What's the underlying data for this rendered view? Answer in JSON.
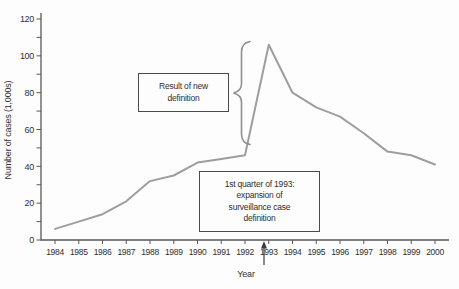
{
  "figure": {
    "bg": "#fdfdfd",
    "line_color": "#9e9e9e",
    "axis_color": "#5a5a5a",
    "text_color": "#303030",
    "brace_color": "#8f8f8f",
    "arrow_color": "#3d3d3d",
    "box_border": "#4a4a4a"
  },
  "chart_data": {
    "type": "line",
    "title": "",
    "xlabel": "Year",
    "ylabel": "Number of cases (1,000s)",
    "x": [
      1984,
      1985,
      1986,
      1987,
      1988,
      1989,
      1990,
      1991,
      1992,
      1993,
      1994,
      1995,
      1996,
      1997,
      1998,
      1999,
      2000
    ],
    "values": [
      6,
      10,
      14,
      21,
      32,
      35,
      42,
      44,
      46,
      106,
      80,
      72,
      67,
      58,
      48,
      46,
      41
    ],
    "xlim": [
      1984,
      2000
    ],
    "ylim": [
      0,
      120
    ],
    "y_major_ticks": [
      0,
      20,
      40,
      60,
      80,
      100,
      120
    ],
    "y_minor_step": 10,
    "grid": false,
    "legend": null,
    "annotations": [
      {
        "name": "result-of-new-definition",
        "marker": "curly-brace",
        "lines": [
          "Result of new",
          "definition"
        ]
      },
      {
        "name": "first-quarter-1993",
        "marker": "up-arrow-at-1993",
        "lines": [
          "1st quarter of 1993:",
          "expansion of",
          "surveillance case",
          "definition"
        ]
      }
    ]
  }
}
